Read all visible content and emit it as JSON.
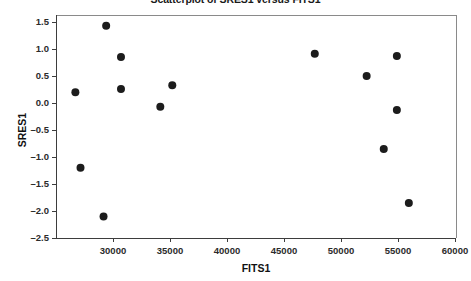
{
  "chart_data": {
    "type": "scatter",
    "title": "Scatterplot of SRES1 versus FITS1",
    "xlabel": "FITS1",
    "ylabel": "SRES1",
    "xlim": [
      26000,
      60000
    ],
    "ylim": [
      -2.65,
      1.65
    ],
    "grid": false,
    "legend": null,
    "x_ticks": [
      30000,
      35000,
      40000,
      45000,
      50000,
      55000,
      60000
    ],
    "x_tick_labels": [
      "30000",
      "35000",
      "40000",
      "45000",
      "50000",
      "55000",
      "60000"
    ],
    "y_ticks": [
      1.5,
      1.0,
      0.5,
      0.0,
      -0.5,
      -1.0,
      -1.5,
      -2.0,
      -2.5
    ],
    "y_tick_labels": [
      "1.5",
      "1.0",
      "0.5",
      "0.0",
      "-0.5",
      "-1.0",
      "-1.5",
      "-2.0",
      "-2.5"
    ],
    "marker": "filled-circle",
    "marker_color": "#1c1c1c",
    "marker_size": 4,
    "n_points": 14,
    "x": [
      26700,
      27150,
      29170,
      29400,
      30700,
      30700,
      34150,
      35200,
      47700,
      52250,
      53750,
      54900,
      54900,
      55950
    ],
    "y": [
      0.2,
      -1.2,
      -2.1,
      1.43,
      0.85,
      0.26,
      -0.07,
      0.33,
      0.91,
      0.5,
      -0.85,
      0.87,
      -0.13,
      -1.85
    ],
    "points": [
      {
        "x": 26700,
        "y": 0.2
      },
      {
        "x": 27150,
        "y": -1.2
      },
      {
        "x": 29170,
        "y": -2.1
      },
      {
        "x": 29400,
        "y": 1.43
      },
      {
        "x": 30700,
        "y": 0.85
      },
      {
        "x": 30700,
        "y": 0.26
      },
      {
        "x": 34150,
        "y": -0.07
      },
      {
        "x": 35200,
        "y": 0.33
      },
      {
        "x": 47700,
        "y": 0.91
      },
      {
        "x": 52250,
        "y": 0.5
      },
      {
        "x": 53750,
        "y": -0.85
      },
      {
        "x": 54900,
        "y": 0.87
      },
      {
        "x": 54900,
        "y": -0.13
      },
      {
        "x": 55950,
        "y": -1.85
      }
    ]
  }
}
